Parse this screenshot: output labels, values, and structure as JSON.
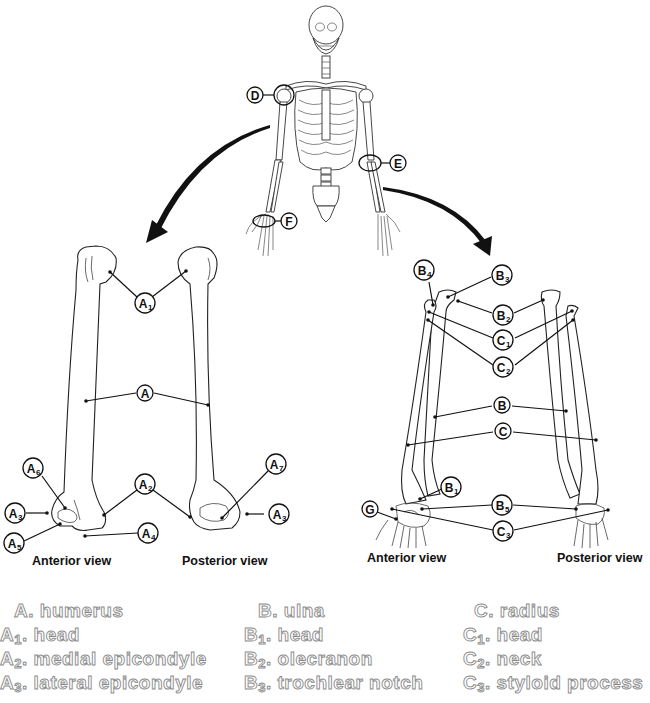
{
  "figure": {
    "skeleton_callouts": [
      {
        "id": "D",
        "label": "D",
        "location": "shoulder"
      },
      {
        "id": "E",
        "label": "E",
        "location": "elbow"
      },
      {
        "id": "F",
        "label": "F",
        "location": "wrist"
      }
    ],
    "humerus_panel": {
      "views": [
        "Anterior view",
        "Posterior view"
      ],
      "callouts": [
        {
          "id": "A1",
          "main": "A",
          "sub": "1"
        },
        {
          "id": "A",
          "main": "A",
          "sub": ""
        },
        {
          "id": "A2",
          "main": "A",
          "sub": "2"
        },
        {
          "id": "A3_left",
          "main": "A",
          "sub": "3"
        },
        {
          "id": "A3_right",
          "main": "A",
          "sub": "3"
        },
        {
          "id": "A4",
          "main": "A",
          "sub": "4"
        },
        {
          "id": "A5",
          "main": "A",
          "sub": "5"
        },
        {
          "id": "A6",
          "main": "A",
          "sub": "6"
        },
        {
          "id": "A7",
          "main": "A",
          "sub": "7"
        }
      ]
    },
    "forearm_panel": {
      "views": [
        "Anterior view",
        "Posterior view"
      ],
      "callouts": [
        {
          "id": "B4",
          "main": "B",
          "sub": "4"
        },
        {
          "id": "B3",
          "main": "B",
          "sub": "3"
        },
        {
          "id": "B2",
          "main": "B",
          "sub": "2"
        },
        {
          "id": "C1",
          "main": "C",
          "sub": "1"
        },
        {
          "id": "C2",
          "main": "C",
          "sub": "2"
        },
        {
          "id": "B",
          "main": "B",
          "sub": ""
        },
        {
          "id": "C",
          "main": "C",
          "sub": ""
        },
        {
          "id": "B1",
          "main": "B",
          "sub": "1"
        },
        {
          "id": "B5",
          "main": "B",
          "sub": "5"
        },
        {
          "id": "G",
          "main": "G",
          "sub": ""
        },
        {
          "id": "C3",
          "main": "C",
          "sub": "3"
        }
      ]
    }
  },
  "legend": {
    "columns": [
      {
        "items": [
          {
            "key": "A",
            "sub": "",
            "text": "humerus"
          },
          {
            "key": "A",
            "sub": "1",
            "text": "head"
          },
          {
            "key": "A",
            "sub": "2",
            "text": "medial epicondyle"
          },
          {
            "key": "A",
            "sub": "3",
            "text": "lateral epicondyle"
          }
        ]
      },
      {
        "items": [
          {
            "key": "B",
            "sub": "",
            "text": "ulna"
          },
          {
            "key": "B",
            "sub": "1",
            "text": "head"
          },
          {
            "key": "B",
            "sub": "2",
            "text": "olecranon"
          },
          {
            "key": "B",
            "sub": "3",
            "text": "trochlear notch"
          }
        ]
      },
      {
        "items": [
          {
            "key": "C",
            "sub": "",
            "text": "radius"
          },
          {
            "key": "C",
            "sub": "1",
            "text": "head"
          },
          {
            "key": "C",
            "sub": "2",
            "text": "neck"
          },
          {
            "key": "C",
            "sub": "3",
            "text": "styloid process"
          }
        ]
      }
    ]
  },
  "colors": {
    "line": "#111111",
    "legend_stroke": "#8a8a8a",
    "background": "#ffffff"
  }
}
